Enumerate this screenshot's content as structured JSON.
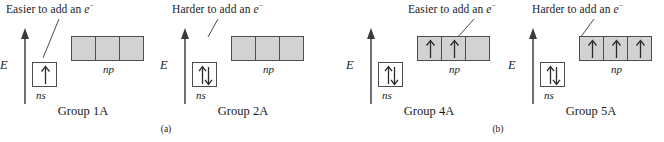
{
  "figure": {
    "panels": [
      {
        "id": "a",
        "caption": "(a)",
        "groups": [
          {
            "id": "1a",
            "title": "Group 1A",
            "callout": {
              "text_before": "Easier to add an ",
              "symbol": "e",
              "charge": "−"
            },
            "axis_label": "E",
            "ns_label": "ns",
            "np_label": "np",
            "ns_occupancy": "up",
            "np_occupancies": [
              "empty",
              "empty",
              "empty"
            ]
          },
          {
            "id": "2a",
            "title": "Group 2A",
            "callout": {
              "text_before": "Harder to add an ",
              "symbol": "e",
              "charge": "−"
            },
            "axis_label": "E",
            "ns_label": "ns",
            "np_label": "np",
            "ns_occupancy": "paired",
            "np_occupancies": [
              "empty",
              "empty",
              "empty"
            ]
          }
        ]
      },
      {
        "id": "b",
        "caption": "(b)",
        "groups": [
          {
            "id": "4a",
            "title": "Group 4A",
            "callout": {
              "text_before": "Easier to add an ",
              "symbol": "e",
              "charge": "−"
            },
            "axis_label": "E",
            "ns_label": "ns",
            "np_label": "np",
            "ns_occupancy": "paired",
            "np_occupancies": [
              "up",
              "up",
              "empty"
            ]
          },
          {
            "id": "5a",
            "title": "Group 5A",
            "callout": {
              "text_before": "Harder to add an ",
              "symbol": "e",
              "charge": "−"
            },
            "axis_label": "E",
            "ns_label": "ns",
            "np_label": "np",
            "ns_occupancy": "paired",
            "np_occupancies": [
              "up",
              "up",
              "up"
            ]
          }
        ]
      }
    ]
  },
  "colors": {
    "box_fill_gray": "#d2d2d2",
    "box_fill_white": "#ffffff",
    "box_stroke": "#4d4d4d",
    "ink": "#1a1a1a"
  }
}
